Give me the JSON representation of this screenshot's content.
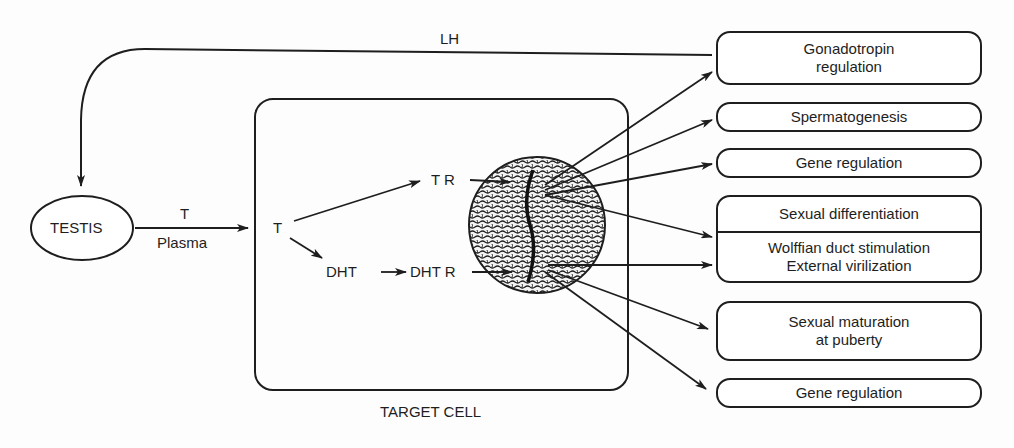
{
  "diagram": {
    "feedback_label": "LH",
    "testis": "TESTIS",
    "plasma_hormone": "T",
    "plasma_label": "Plasma",
    "target_cell": {
      "label": "TARGET CELL",
      "t": "T",
      "tr": "T R",
      "dht": "DHT",
      "dhtr": "DHT R"
    },
    "outcomes": [
      {
        "line1": "Gonadotropin",
        "line2": "regulation"
      },
      {
        "line1": "Spermatogenesis"
      },
      {
        "line1": "Gene regulation"
      },
      {
        "header": "Sexual differentiation",
        "line1": "Wolffian duct stimulation",
        "line2": "External virilization"
      },
      {
        "line1": "Sexual maturation",
        "line2": "at puberty"
      },
      {
        "line1": "Gene regulation"
      }
    ]
  }
}
